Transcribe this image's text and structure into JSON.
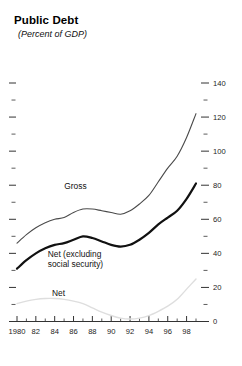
{
  "header": {
    "title": "Public Debt",
    "subtitle": "(Percent of GDP)"
  },
  "chart_data": {
    "type": "line",
    "title": "Public Debt",
    "subtitle": "(Percent of GDP)",
    "xlabel": "",
    "ylabel": "",
    "ylim": [
      0,
      145
    ],
    "xlim": [
      1980,
      1999.5
    ],
    "grid": false,
    "legend_position": "inline-annotations",
    "y_axis_side": "right",
    "y_ticks_major": [
      0,
      20,
      40,
      60,
      80,
      100,
      120,
      140
    ],
    "y_ticks_minor": [
      10,
      30,
      50,
      70,
      90,
      110,
      130
    ],
    "y_tick_labels": [
      "0",
      "20",
      "40",
      "60",
      "80",
      "100",
      "120",
      "140"
    ],
    "x_ticks_major": [
      1980,
      1982,
      1984,
      1986,
      1988,
      1990,
      1992,
      1994,
      1996,
      1998
    ],
    "x_tick_labels": [
      "1980",
      "82",
      "84",
      "86",
      "88",
      "90",
      "92",
      "94",
      "96",
      "98"
    ],
    "x_ticks_minor": [
      1981,
      1983,
      1985,
      1987,
      1989,
      1991,
      1993,
      1995,
      1997,
      1999
    ],
    "x": [
      1980,
      1981,
      1982,
      1983,
      1984,
      1985,
      1986,
      1987,
      1988,
      1989,
      1990,
      1991,
      1992,
      1993,
      1994,
      1995,
      1996,
      1997,
      1998,
      1999
    ],
    "series": [
      {
        "name": "Gross",
        "label": "Gross",
        "color": "#4a4a4a",
        "width": 1.1,
        "label_x": 1986.2,
        "label_y": 78,
        "values": [
          46,
          51,
          55,
          58,
          60,
          61,
          64,
          66,
          66,
          65,
          64,
          63,
          65,
          69,
          74,
          82,
          90,
          97,
          108,
          122
        ]
      },
      {
        "name": "Net (excluding social security)",
        "label": "Net (excluding social security)",
        "label_line1": "Net (excluding",
        "label_line2": "social security)",
        "color": "#111111",
        "width": 2.2,
        "label_x": 1985.6,
        "label_y": 38,
        "values": [
          31,
          36,
          40,
          43,
          45,
          46,
          48,
          50,
          49,
          47,
          45,
          44,
          45,
          48,
          52,
          57,
          61,
          65,
          72,
          81
        ]
      },
      {
        "name": "Net",
        "label": "Net",
        "color": "#dedede",
        "width": 1.4,
        "label_x": 1984.4,
        "label_y": 15,
        "values": [
          10.5,
          12,
          13,
          13.5,
          13.5,
          13,
          12,
          10.5,
          8,
          5.5,
          3.5,
          2,
          1.5,
          2,
          3.5,
          6,
          9,
          13,
          19,
          25
        ]
      }
    ],
    "colors": {
      "gross": "#4a4a4a",
      "net_excl_social_security": "#111111",
      "net": "#dedede",
      "axis": "#333333",
      "background": "#ffffff"
    }
  }
}
